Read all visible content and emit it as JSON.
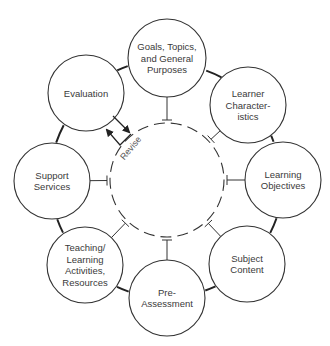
{
  "diagram": {
    "colors": {
      "stroke": "#333333",
      "text": "#3a3a3a",
      "background": "#ffffff"
    },
    "center": {
      "cx": 167,
      "cy": 180,
      "r": 57,
      "style": "dashed"
    },
    "ring_radius": 122,
    "nodes": [
      {
        "id": "goals",
        "lines": [
          "Goals, Topics,",
          "and General",
          "Purposes"
        ],
        "cx": 167,
        "cy": 58,
        "r": 39
      },
      {
        "id": "learner",
        "lines": [
          "Learner",
          "Character-",
          "istics"
        ],
        "cx": 248,
        "cy": 105,
        "r": 38
      },
      {
        "id": "objectives",
        "lines": [
          "Learning",
          "Objectives"
        ],
        "cx": 283,
        "cy": 180,
        "r": 38
      },
      {
        "id": "content",
        "lines": [
          "Subject",
          "Content"
        ],
        "cx": 247,
        "cy": 264,
        "r": 38
      },
      {
        "id": "preassessment",
        "lines": [
          "Pre-",
          "Assessment"
        ],
        "cx": 167,
        "cy": 298,
        "r": 38
      },
      {
        "id": "teaching",
        "lines": [
          "Teaching/",
          "Learning",
          "Activities,",
          "Resources"
        ],
        "cx": 85,
        "cy": 265,
        "r": 38
      },
      {
        "id": "support",
        "lines": [
          "Support",
          "Services"
        ],
        "cx": 52,
        "cy": 181,
        "r": 38
      },
      {
        "id": "evaluation",
        "lines": [
          "Evaluation"
        ],
        "cx": 86,
        "cy": 93,
        "r": 38
      }
    ],
    "revise": {
      "label": "Revise",
      "x": 133,
      "y": 150,
      "rotation": -50
    }
  }
}
